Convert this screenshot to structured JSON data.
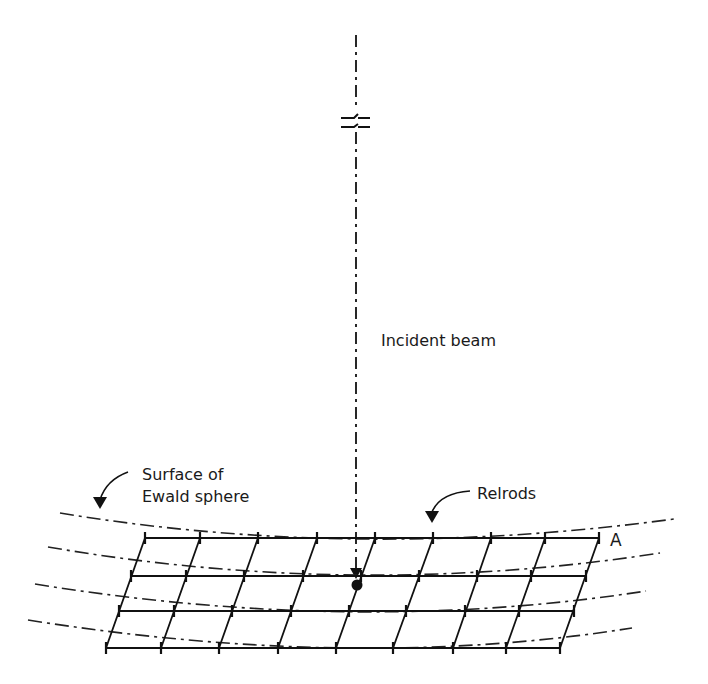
{
  "labels": {
    "incident_beam": "Incident beam",
    "ewald_line1": "Surface of",
    "ewald_line2": "Ewald sphere",
    "relrods": "Relrods",
    "corner_a": "A"
  },
  "colors": {
    "line": "#111111",
    "background": "#ffffff"
  },
  "geometry": {
    "beam_x": 356,
    "beam_top_y": 35,
    "beam_bottom_y": 575,
    "origin_dot": [
      357,
      585
    ],
    "grid_rows_y": [
      538,
      576,
      611,
      648
    ],
    "grid_top_ticks_x": [
      145,
      200,
      258,
      317,
      375,
      433,
      491,
      545,
      599
    ],
    "grid_bottom_ticks_x": [
      106,
      161,
      219,
      278,
      336,
      393,
      453,
      506,
      560
    ]
  }
}
